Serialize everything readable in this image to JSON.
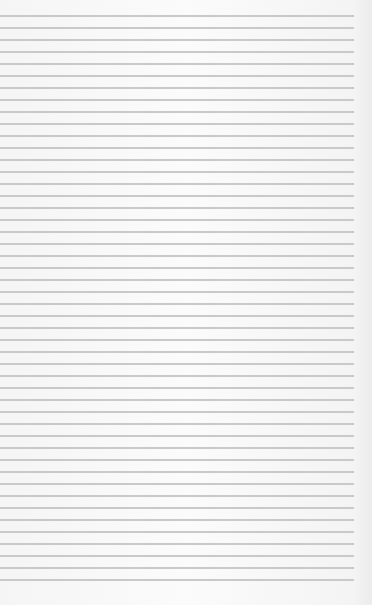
{
  "paper": {
    "background": "#f8f8f8",
    "line_color": "#c9c9c9",
    "first_line_y": 15,
    "line_spacing": 12,
    "line_count": 48,
    "line_start_x": 0,
    "line_end_x": 354
  }
}
